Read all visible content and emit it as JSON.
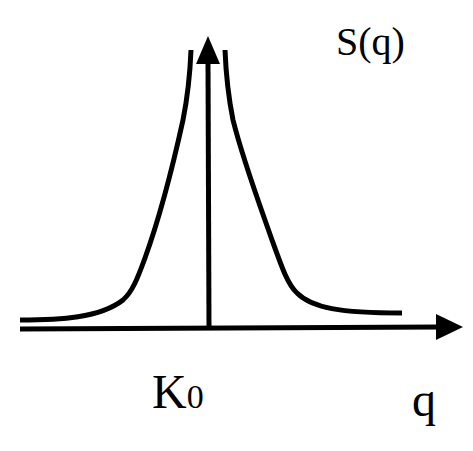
{
  "diagram": {
    "y_axis_label": "S(q)",
    "x_axis_label": "q",
    "peak_label": {
      "main": "K",
      "subscript": "0"
    },
    "curve_type": "symmetric peak centered at K0"
  },
  "colors": {
    "stroke": "#000000",
    "background": "#ffffff"
  }
}
